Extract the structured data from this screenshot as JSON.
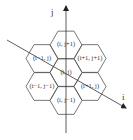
{
  "diagram": {
    "type": "hexagonal-grid-neighborhood",
    "axes": {
      "vertical_label": "j",
      "diagonal_label": "i"
    },
    "cells": [
      {
        "label": "(i, j+1)",
        "cx": 66,
        "cy": 45
      },
      {
        "label": "(i−1, j)",
        "cx": 42,
        "cy": 58.5
      },
      {
        "label": "(i+1, j+1)",
        "cx": 90,
        "cy": 58.5
      },
      {
        "label": "(i, j)",
        "cx": 66,
        "cy": 72.5
      },
      {
        "label": "(i−1, j−1)",
        "cx": 42,
        "cy": 86.5
      },
      {
        "label": "(i+1, j)",
        "cx": 90,
        "cy": 86.5
      },
      {
        "label": "(i, j−1)",
        "cx": 66,
        "cy": 100.5
      }
    ],
    "colors": {
      "line": "#555555",
      "text": "#333333",
      "background": "#ffffff"
    }
  }
}
